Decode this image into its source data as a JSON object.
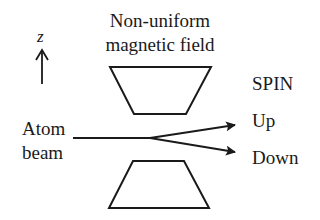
{
  "diagram": {
    "title_line1": "Non-uniform",
    "title_line2": "magnetic field",
    "axis_label": "z",
    "source_label_line1": "Atom",
    "source_label_line2": "beam",
    "spin_heading": "SPIN",
    "outputs": [
      {
        "label": "Up"
      },
      {
        "label": "Down"
      }
    ],
    "colors": {
      "stroke": "#1a1a1a",
      "background": "#ffffff"
    }
  }
}
